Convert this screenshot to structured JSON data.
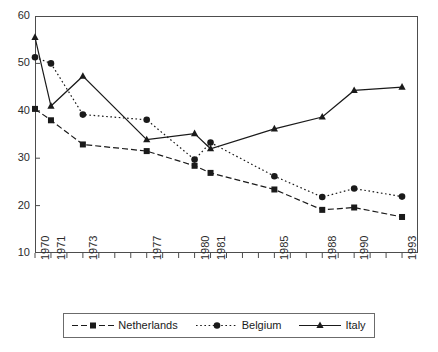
{
  "chart_data": {
    "type": "line",
    "title": "",
    "subtitle": "",
    "xlabel": "",
    "ylabel": "",
    "grid": false,
    "legend_position": "bottom-center",
    "ylim": [
      10,
      60
    ],
    "ytick_labels": [
      "60",
      "50",
      "40",
      "30",
      "20",
      "10"
    ],
    "ytick_values": [
      60,
      50,
      40,
      30,
      20,
      10
    ],
    "xlim": [
      1970,
      1994
    ],
    "x_all_ticks": [
      1970,
      1971,
      1972,
      1973,
      1974,
      1975,
      1976,
      1977,
      1978,
      1979,
      1980,
      1981,
      1982,
      1983,
      1984,
      1985,
      1986,
      1987,
      1988,
      1989,
      1990,
      1991,
      1992,
      1993
    ],
    "xtick_labels": [
      "1970",
      "1971",
      "1973",
      "1977",
      "1980",
      "1981",
      "1985",
      "1988",
      "1990",
      "1993"
    ],
    "xtick_values": [
      1970,
      1971,
      1973,
      1977,
      1980,
      1981,
      1985,
      1988,
      1990,
      1993
    ],
    "categories": [
      1970,
      1971,
      1973,
      1977,
      1980,
      1981,
      1985,
      1988,
      1990,
      1993
    ],
    "series": [
      {
        "name": "Netherlands",
        "marker": "square",
        "line_style": "dashed",
        "color": "#1a1a1a",
        "values": [
          40.4,
          38.0,
          32.9,
          31.5,
          28.4,
          26.9,
          23.4,
          19.1,
          19.6,
          17.6
        ]
      },
      {
        "name": "Belgium",
        "marker": "circle",
        "line_style": "dotted",
        "color": "#1a1a1a",
        "values": [
          51.3,
          50.0,
          39.2,
          38.1,
          29.7,
          33.3,
          26.2,
          21.8,
          23.6,
          21.9
        ]
      },
      {
        "name": "Italy",
        "marker": "triangle",
        "line_style": "solid",
        "color": "#1a1a1a",
        "values": [
          55.5,
          41.0,
          47.3,
          33.9,
          35.2,
          32.0,
          36.2,
          38.7,
          44.3,
          45.0
        ]
      }
    ]
  },
  "axes": {
    "y_labels": [
      "60",
      "50",
      "40",
      "30",
      "20",
      "10"
    ],
    "x_labels": [
      "1970",
      "1971",
      "1973",
      "1977",
      "1980",
      "1981",
      "1985",
      "1988",
      "1990",
      "1993"
    ]
  },
  "legend": {
    "entries": [
      {
        "label": "Netherlands",
        "marker": "square-marker",
        "style": "dashed"
      },
      {
        "label": "Belgium",
        "marker": "circle-marker",
        "style": "dotted"
      },
      {
        "label": "Italy",
        "marker": "triangle-marker",
        "style": "solid"
      }
    ]
  },
  "colors": {
    "ink": "#1a1a1a",
    "axis": "#4d4d4d",
    "background": "#ffffff"
  }
}
